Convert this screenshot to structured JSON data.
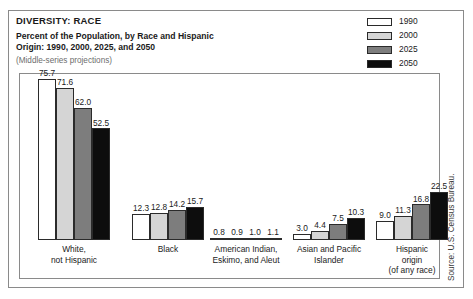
{
  "figure": {
    "title": "DIVERSITY: RACE",
    "subtitle_line1": "Percent of the Population, by Race and Hispanic",
    "subtitle_line2": "Origin: 1990, 2000, 2025, and 2050",
    "note": "(Middle-series projections)",
    "source": "Source: U.S. Census Bureau."
  },
  "legend": {
    "items": [
      {
        "label": "1990",
        "color": "#ffffff"
      },
      {
        "label": "2000",
        "color": "#d5d5d5"
      },
      {
        "label": "2025",
        "color": "#7d7d7d"
      },
      {
        "label": "2050",
        "color": "#0d0d0d"
      }
    ]
  },
  "chart_data": {
    "type": "bar",
    "title": "DIVERSITY: RACE",
    "subtitle": "Percent of the Population, by Race and Hispanic Origin: 1990, 2000, 2025, and 2050 (Middle-series projections)",
    "xlabel": "",
    "ylabel": "Percent of the Population",
    "ylim": [
      0,
      80
    ],
    "grid": false,
    "legend_position": "top-right",
    "categories": [
      "White, not Hispanic",
      "Black",
      "American Indian, Eskimo, and Aleut",
      "Asian and Pacific Islander",
      "Hispanic origin (of any race)"
    ],
    "category_lines": [
      [
        "White,",
        "not Hispanic"
      ],
      [
        "Black"
      ],
      [
        "American Indian,",
        "Eskimo, and Aleut"
      ],
      [
        "Asian and Pacific",
        "Islander"
      ],
      [
        "Hispanic",
        "origin",
        "(of any race)"
      ]
    ],
    "series": [
      {
        "name": "1990",
        "color": "#ffffff",
        "values": [
          75.7,
          12.3,
          0.8,
          3.0,
          9.0
        ]
      },
      {
        "name": "2000",
        "color": "#d5d5d5",
        "values": [
          71.6,
          12.8,
          0.9,
          4.4,
          11.3
        ]
      },
      {
        "name": "2025",
        "color": "#7d7d7d",
        "values": [
          62.0,
          14.2,
          1.0,
          7.5,
          16.8
        ]
      },
      {
        "name": "2050",
        "color": "#0d0d0d",
        "values": [
          52.5,
          15.7,
          1.1,
          10.3,
          22.5
        ]
      }
    ],
    "value_labels": [
      [
        "75.7",
        "71.6",
        "62.0",
        "52.5"
      ],
      [
        "12.3",
        "12.8",
        "14.2",
        "15.7"
      ],
      [
        "0.8",
        "0.9",
        "1.0",
        "1.1"
      ],
      [
        "3.0",
        "4.4",
        "7.5",
        "10.3"
      ],
      [
        "9.0",
        "11.3",
        "16.8",
        "22.5"
      ]
    ]
  }
}
